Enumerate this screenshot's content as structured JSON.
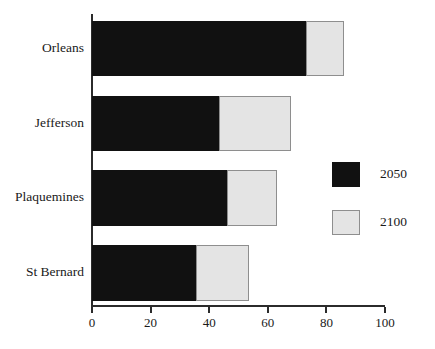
{
  "chart_data": {
    "type": "bar",
    "orientation": "horizontal",
    "stacked": true,
    "title": "",
    "subtitle": "",
    "xlabel": "",
    "ylabel": "",
    "xlim": [
      0,
      100
    ],
    "ylim": null,
    "grid": false,
    "legend_position": "right-middle",
    "categories": [
      "Orleans",
      "Jefferson",
      "Plaquemines",
      "St Bernard"
    ],
    "xticks": [
      0,
      20,
      40,
      60,
      80,
      100
    ],
    "xtick_labels": [
      "0",
      "20",
      "40",
      "60",
      "80",
      "100"
    ],
    "series": [
      {
        "name": "2050",
        "color": "#111111",
        "values": [
          73,
          43.5,
          46,
          35.5
        ]
      },
      {
        "name": "2100",
        "color": "#e4e4e4",
        "values": [
          13,
          24.5,
          17,
          18
        ]
      }
    ],
    "cumulative_totals": [
      86,
      68,
      63,
      53.5
    ],
    "annotations": []
  },
  "legend": {
    "entries": [
      {
        "label": "2050",
        "swatch": "black-swatch-icon"
      },
      {
        "label": "2100",
        "swatch": "light-gray-swatch-icon"
      }
    ]
  },
  "axis": {
    "x_axis_name": "x-axis",
    "y_axis_name": "y-axis"
  },
  "colors": {
    "series_2050": "#111111",
    "series_2100": "#e4e4e4",
    "series_2100_border": "#8e8e8e",
    "axis": "#2b2b2b",
    "text": "#1a1a1a",
    "background": "#ffffff"
  }
}
